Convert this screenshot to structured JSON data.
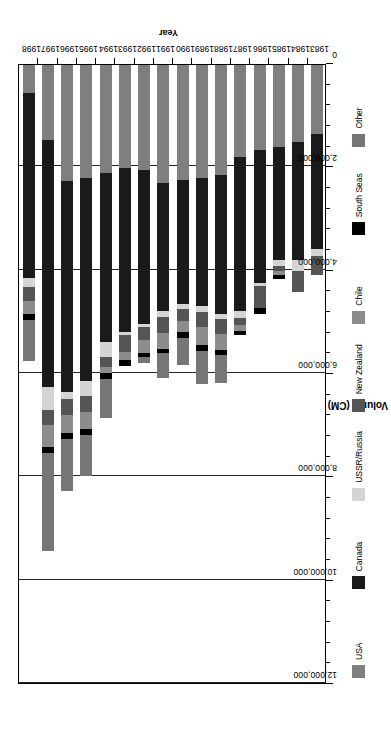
{
  "chart": {
    "type": "bar",
    "orientation": "rotated-90-ccw",
    "axis_titles": {
      "value": "Volume (CM)",
      "category": "Year"
    }
  },
  "chart_data": {
    "type": "bar",
    "title": "",
    "subtitle": "",
    "xlabel": "Year",
    "ylabel": "Volume (CM)",
    "ylim": [
      0,
      12000000
    ],
    "grid": true,
    "stacked": true,
    "legend_position": "bottom",
    "tick_labels": [
      "0",
      "2,000,000",
      "4,000,000",
      "6,000,000",
      "8,000,000",
      "10,000,000",
      "12,000,000"
    ],
    "tick_values": [
      0,
      2000000,
      4000000,
      6000000,
      8000000,
      10000000,
      12000000
    ],
    "minor_ticks_per_interval": 4,
    "categories": [
      "1983",
      "1984",
      "1985",
      "1986",
      "1987",
      "1988",
      "1989",
      "1990",
      "1991",
      "1992",
      "1993",
      "1994",
      "1995",
      "1996",
      "1997",
      "1998"
    ],
    "series": [
      {
        "name": "USA",
        "color": "#7f7f7f",
        "values": [
          1350000,
          1500000,
          1600000,
          1650000,
          1800000,
          2150000,
          2200000,
          2250000,
          2300000,
          2050000,
          2000000,
          2100000,
          2200000,
          2250000,
          1450000,
          550000
        ]
      },
      {
        "name": "Canada",
        "color": "#1a1a1a",
        "values": [
          2250000,
          2300000,
          2200000,
          2600000,
          3000000,
          2700000,
          2500000,
          2400000,
          2500000,
          3000000,
          3200000,
          3300000,
          3950000,
          4100000,
          4800000,
          3600000
        ]
      },
      {
        "name": "USSR/Russia",
        "color": "#d4d4d4",
        "values": [
          130000,
          230000,
          130000,
          60000,
          130000,
          100000,
          110000,
          110000,
          110000,
          60000,
          60000,
          280000,
          290000,
          140000,
          460000,
          170000
        ]
      },
      {
        "name": "New Zealand",
        "color": "#555555",
        "values": [
          380000,
          400000,
          100000,
          440000,
          130000,
          290000,
          300000,
          220000,
          310000,
          240000,
          330000,
          200000,
          300000,
          310000,
          290000,
          280000
        ]
      },
      {
        "name": "Chile",
        "color": "#8c8c8c",
        "values": [
          0,
          0,
          70000,
          0,
          120000,
          310000,
          340000,
          220000,
          320000,
          260000,
          150000,
          110000,
          330000,
          350000,
          420000,
          250000
        ]
      },
      {
        "name": "South Seas",
        "color": "#000000",
        "values": [
          0,
          0,
          80000,
          110000,
          90000,
          100000,
          130000,
          120000,
          70000,
          80000,
          120000,
          130000,
          130000,
          130000,
          130000,
          110000
        ]
      },
      {
        "name": "Other",
        "color": "#767676",
        "values": [
          0,
          0,
          0,
          0,
          0,
          540000,
          630000,
          530000,
          480000,
          110000,
          0,
          760000,
          800000,
          1000000,
          1900000,
          800000
        ]
      }
    ]
  },
  "legend": {
    "items": [
      {
        "label": "USA",
        "color": "#7f7f7f"
      },
      {
        "label": "Canada",
        "color": "#1a1a1a"
      },
      {
        "label": "USSR/Russia",
        "color": "#d4d4d4"
      },
      {
        "label": "New Zealand",
        "color": "#555555"
      },
      {
        "label": "Chile",
        "color": "#8c8c8c"
      },
      {
        "label": "South Seas",
        "color": "#000000"
      },
      {
        "label": "Other",
        "color": "#767676"
      }
    ]
  }
}
